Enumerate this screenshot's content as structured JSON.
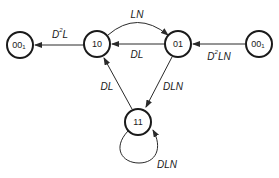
{
  "diagram": {
    "type": "state-transition",
    "nodes": [
      {
        "id": "n00_left",
        "label": "00",
        "subscript": "1",
        "cx": 20,
        "cy": 45
      },
      {
        "id": "n10",
        "label": "10",
        "subscript": "",
        "cx": 97,
        "cy": 44
      },
      {
        "id": "n01",
        "label": "01",
        "subscript": "",
        "cx": 178,
        "cy": 44
      },
      {
        "id": "n00_right",
        "label": "00",
        "subscript": "1",
        "cx": 259,
        "cy": 44
      },
      {
        "id": "n11",
        "label": "11",
        "subscript": "",
        "cx": 138,
        "cy": 122
      }
    ],
    "edges": [
      {
        "from": "10",
        "to": "00_1 (left)",
        "label_base": "D",
        "label_sup": "2",
        "label_rest": "L"
      },
      {
        "from": "10",
        "to": "01",
        "label_base": "LN",
        "label_sup": "",
        "label_rest": "",
        "curved": true
      },
      {
        "from": "01",
        "to": "10",
        "label_base": "DL",
        "label_sup": "",
        "label_rest": ""
      },
      {
        "from": "00_1 (right)",
        "to": "01",
        "label_base": "D",
        "label_sup": "2",
        "label_rest": "LN"
      },
      {
        "from": "11",
        "to": "10",
        "label_base": "DL",
        "label_sup": "",
        "label_rest": ""
      },
      {
        "from": "01",
        "to": "11",
        "label_base": "DLN",
        "label_sup": "",
        "label_rest": ""
      },
      {
        "from": "11",
        "to": "11",
        "label_base": "DLN",
        "label_sup": "",
        "label_rest": "",
        "self_loop": true
      }
    ]
  },
  "labels": {
    "node_00_left": "00",
    "node_00_left_sub": "1",
    "node_10": "10",
    "node_01": "01",
    "node_00_right": "00",
    "node_00_right_sub": "1",
    "node_11": "11",
    "edge_10_to_00_base": "D",
    "edge_10_to_00_sup": "2",
    "edge_10_to_00_rest": "L",
    "edge_10_to_01": "LN",
    "edge_01_to_10": "DL",
    "edge_00_to_01_base": "D",
    "edge_00_to_01_sup": "2",
    "edge_00_to_01_rest": "LN",
    "edge_11_to_10": "DL",
    "edge_01_to_11": "DLN",
    "edge_11_self": "DLN"
  },
  "colors": {
    "stroke": "#1a1a1a",
    "background": "#ffffff"
  }
}
